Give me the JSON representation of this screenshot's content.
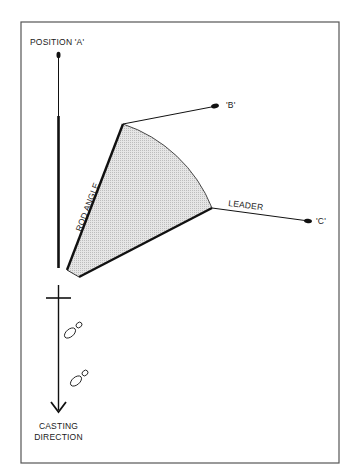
{
  "diagram": {
    "type": "fly-casting rod angle illustration",
    "labels": {
      "position_a": "POSITION 'A'",
      "point_b": "'B'",
      "point_c": "'C'",
      "rod_angle": "ROD ANGLE",
      "leader": "LEADER",
      "casting_direction_line1": "CASTING",
      "casting_direction_line2": "DIRECTION"
    },
    "colors": {
      "line": "#111111",
      "frame": "#555555",
      "fill": "#d9d9d9",
      "background": "#ffffff"
    },
    "elements": [
      "vertical rod at position A with line tip",
      "shaded fan sector showing rod angle",
      "leader line to point B",
      "leader line to point C",
      "caster's feet (two footprints)",
      "casting direction arrow"
    ]
  }
}
